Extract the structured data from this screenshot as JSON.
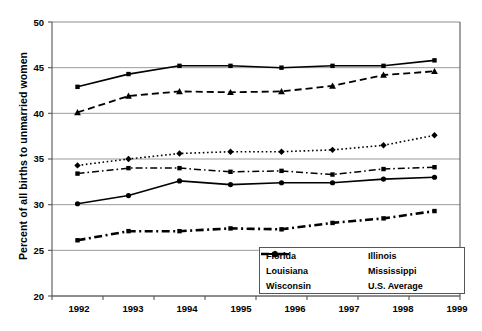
{
  "chart_data": {
    "type": "line",
    "title": "",
    "xlabel": "",
    "ylabel": "Percent of all births to unmarried women",
    "categories": [
      "1992",
      "1993",
      "1994",
      "1995",
      "1996",
      "1997",
      "1998",
      "1999"
    ],
    "ylim": [
      20,
      50
    ],
    "yticks": [
      20,
      25,
      30,
      35,
      40,
      45,
      50
    ],
    "grid": "horizontal",
    "legend_position": "inside-bottom-right",
    "series": [
      {
        "name": "Florida",
        "values": [
          34.3,
          35.0,
          35.6,
          35.8,
          35.8,
          36.0,
          36.5,
          37.6
        ],
        "line_style": "dotted",
        "marker": "diamond",
        "color": "#000000"
      },
      {
        "name": "Illinois",
        "values": [
          33.4,
          34.0,
          34.0,
          33.6,
          33.7,
          33.3,
          33.9,
          34.1
        ],
        "line_style": "dash-dot",
        "marker": "square",
        "color": "#000000"
      },
      {
        "name": "Louisiana",
        "values": [
          40.1,
          41.9,
          42.4,
          42.3,
          42.4,
          43.0,
          44.2,
          44.6
        ],
        "line_style": "dashed",
        "marker": "triangle",
        "color": "#000000"
      },
      {
        "name": "Mississippi",
        "values": [
          42.9,
          44.3,
          45.2,
          45.2,
          45.0,
          45.2,
          45.2,
          45.8
        ],
        "line_style": "solid",
        "marker": "square",
        "color": "#000000"
      },
      {
        "name": "Wisconsin",
        "values": [
          26.1,
          27.1,
          27.1,
          27.4,
          27.3,
          28.0,
          28.5,
          29.3
        ],
        "line_style": "dash-dot-bold",
        "marker": "square",
        "color": "#000000"
      },
      {
        "name": "U.S. Average",
        "values": [
          30.1,
          31.0,
          32.6,
          32.2,
          32.4,
          32.4,
          32.8,
          33.0
        ],
        "line_style": "solid",
        "marker": "circle",
        "color": "#000000"
      }
    ]
  },
  "axis": {
    "y_tick_labels": [
      "50",
      "45",
      "40",
      "35",
      "30",
      "25",
      "20"
    ],
    "x_tick_labels": [
      "1992",
      "1993",
      "1994",
      "1995",
      "1996",
      "1997",
      "1998",
      "1999"
    ],
    "y_title": "Percent of all births to unmarried women"
  },
  "legend": {
    "entries": [
      {
        "label": "Florida"
      },
      {
        "label": "Illinois"
      },
      {
        "label": "Louisiana"
      },
      {
        "label": "Mississippi"
      },
      {
        "label": "Wisconsin"
      },
      {
        "label": "U.S. Average"
      }
    ]
  },
  "colors": {
    "line": "#000000",
    "grid": "#808080",
    "axis": "#555555",
    "background": "#ffffff"
  }
}
